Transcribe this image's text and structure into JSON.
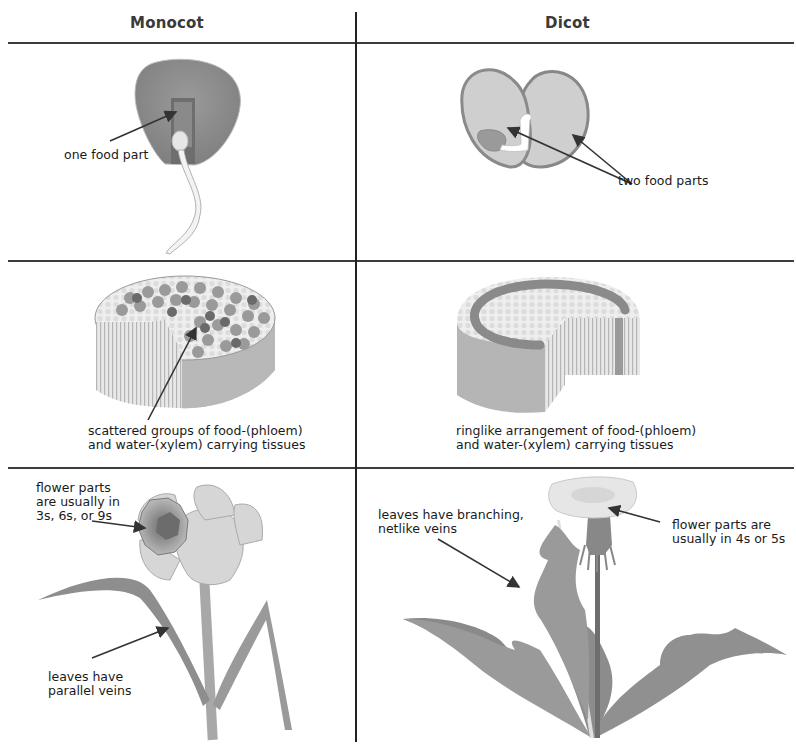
{
  "headers": {
    "monocot": "Monocot",
    "dicot": "Dicot"
  },
  "rows": [
    {
      "name": "seed",
      "monocot": {
        "label": "one food part"
      },
      "dicot": {
        "label": "two food parts"
      }
    },
    {
      "name": "stem",
      "monocot": {
        "label_line1": "scattered groups of food-(phloem)",
        "label_line2": "and water-(xylem) carrying tissues"
      },
      "dicot": {
        "label_line1": "ringlike arrangement of food-(phloem)",
        "label_line2": "and water-(xylem) carrying tissues"
      }
    },
    {
      "name": "flower-leaf",
      "monocot": {
        "flower_label_line1": "flower parts",
        "flower_label_line2": "are usually in",
        "flower_label_line3": "3s, 6s, or 9s",
        "leaf_label_line1": "leaves have",
        "leaf_label_line2": "parallel veins"
      },
      "dicot": {
        "leaf_label_line1": "leaves have branching,",
        "leaf_label_line2": "netlike veins",
        "flower_label_line1": "flower parts are",
        "flower_label_line2": "usually in 4s or 5s"
      }
    }
  ],
  "colors": {
    "grid_line": "#3c3c3c",
    "dark_gray": "#7a7a7a",
    "mid_gray": "#9a9a9a",
    "light_gray": "#cfcfcf",
    "arrow": "#333333"
  }
}
